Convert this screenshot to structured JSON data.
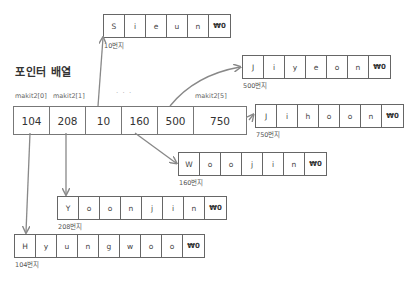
{
  "title": "포인터 배열",
  "pointer_array": {
    "labels": {
      "first": "makit2[0]",
      "second": "makit2[1]",
      "ellipsis": "· · ·",
      "last": "makit2[5]"
    },
    "cells": [
      "104",
      "208",
      "10",
      "160",
      "500",
      "750"
    ]
  },
  "strings": {
    "sieun": {
      "address": "10번지",
      "chars": [
        "S",
        "i",
        "e",
        "u",
        "n",
        "₩0"
      ]
    },
    "jiyeon": {
      "address": "500번지",
      "chars": [
        "J",
        "i",
        "y",
        "e",
        "o",
        "n",
        "₩0"
      ]
    },
    "jihoon": {
      "address": "750번지",
      "chars": [
        "J",
        "i",
        "h",
        "o",
        "o",
        "n",
        "₩0"
      ]
    },
    "woojin": {
      "address": "160번지",
      "chars": [
        "W",
        "o",
        "o",
        "j",
        "i",
        "n",
        "₩0"
      ]
    },
    "yoonjin": {
      "address": "208번지",
      "chars": [
        "Y",
        "o",
        "o",
        "n",
        "j",
        "i",
        "n",
        "₩0"
      ]
    },
    "hyungwoo": {
      "address": "104번지",
      "chars": [
        "H",
        "y",
        "u",
        "n",
        "g",
        "w",
        "o",
        "o",
        "₩0"
      ]
    }
  },
  "colors": {
    "line": "#777777",
    "arrow": "#888888",
    "text": "#444444"
  }
}
